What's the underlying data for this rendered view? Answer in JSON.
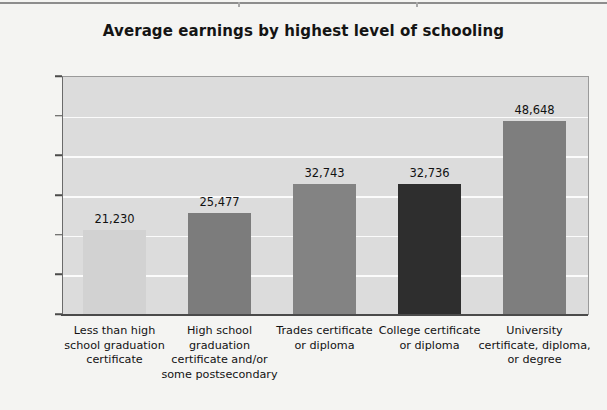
{
  "page": {
    "background_color": "#f4f4f2",
    "top_rule_color": "#8d8d8d"
  },
  "chart_data": {
    "type": "bar",
    "title": "Average earnings by highest level of schooling",
    "xlabel": "",
    "ylabel": "",
    "ylim": [
      0,
      60000
    ],
    "ytick_step": 10000,
    "grid": true,
    "legend": "none",
    "plot_background": "#dcdcdc",
    "gridline_color": "#fbfbfb",
    "categories": [
      "Less than high school graduation certificate",
      "High school graduation certificate and/or some postsecondary",
      "Trades certificate or diploma",
      "College certificate or diploma",
      "University certificate, diploma, or degree"
    ],
    "category_lines": [
      [
        "Less than high",
        "school graduation",
        "certificate"
      ],
      [
        "High school",
        "graduation",
        "certificate and/or",
        "some postsecondary"
      ],
      [
        "Trades certificate",
        "or diploma"
      ],
      [
        "College certificate",
        "or diploma"
      ],
      [
        "University",
        "certificate, diploma,",
        "or degree"
      ]
    ],
    "values": [
      21230,
      25477,
      32743,
      32736,
      48648
    ],
    "value_labels": [
      "21,230",
      "25,477",
      "32,743",
      "32,736",
      "48,648"
    ],
    "bar_colors": [
      "#d2d2d2",
      "#7c7c7c",
      "#838383",
      "#2e2e2e",
      "#7e7e7e"
    ],
    "ytick_labels": [
      "60,000",
      "50,000",
      "40,000",
      "30,000",
      "20,000",
      "10,000",
      "0"
    ],
    "ytick_values": [
      60000,
      50000,
      40000,
      30000,
      20000,
      10000,
      0
    ]
  }
}
